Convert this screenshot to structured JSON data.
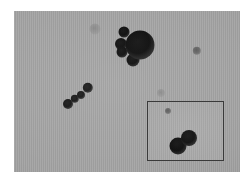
{
  "figure": {
    "kind": "microscopy-image",
    "modality": "grayscale transmission micrograph of spherical particles",
    "alt_text": "Grayscale micrograph showing dark spherical particles on a light gray background, with a boxed magnified inset of a two-particle dimer at bottom right",
    "canvas": {
      "width": 251,
      "height": 185,
      "background_color": "#ffffff"
    },
    "field": {
      "x": 14,
      "y": 11,
      "width": 226,
      "height": 161,
      "background_color": "#a3a3a3"
    },
    "colors": {
      "page_background": "#ffffff",
      "field_background": "#a3a3a3",
      "inset_background": "#a8a8a8",
      "inset_border": "#3a3a3a",
      "particle_dark": "#0d0d0d",
      "particle_mid": "#1d1d1d",
      "particle_faint": "#6a6a6a"
    },
    "main_particles": [
      {
        "id": "large-blob",
        "cx": 126,
        "cy": 34,
        "r": 14.5,
        "tone": "strong"
      },
      {
        "id": "satellite-top",
        "cx": 110,
        "cy": 21,
        "r": 5.5,
        "tone": "strong"
      },
      {
        "id": "satellite-left-up",
        "cx": 107,
        "cy": 33,
        "r": 6.0,
        "tone": "strong"
      },
      {
        "id": "satellite-left-lo",
        "cx": 108,
        "cy": 41,
        "r": 5.5,
        "tone": "strong"
      },
      {
        "id": "satellite-bottom",
        "cx": 119,
        "cy": 49,
        "r": 6.5,
        "tone": "strong"
      },
      {
        "id": "chain-1",
        "cx": 54,
        "cy": 93,
        "r": 5.0,
        "tone": "mid"
      },
      {
        "id": "chain-2",
        "cx": 61,
        "cy": 88,
        "r": 4.2,
        "tone": "mid"
      },
      {
        "id": "chain-3",
        "cx": 67,
        "cy": 84,
        "r": 4.0,
        "tone": "mid"
      },
      {
        "id": "chain-4",
        "cx": 74,
        "cy": 77,
        "r": 5.2,
        "tone": "mid"
      },
      {
        "id": "isolated-right",
        "cx": 183,
        "cy": 40,
        "r": 4.2,
        "tone": "faint"
      },
      {
        "id": "smudge-top-center",
        "cx": 81,
        "cy": 18,
        "r": 5.5,
        "tone": "ghost"
      },
      {
        "id": "smudge-mid-field",
        "cx": 147,
        "cy": 82,
        "r": 4.0,
        "tone": "ghost"
      }
    ],
    "inset": {
      "label": "magnified-inset",
      "x": 147,
      "y": 101,
      "width": 77,
      "height": 60,
      "border_width_px": 1,
      "particles": [
        {
          "id": "dimer-lower-left",
          "cx": 30,
          "cy": 44,
          "r": 8.5,
          "tone": "strong"
        },
        {
          "id": "dimer-upper-right",
          "cx": 41,
          "cy": 36,
          "r": 8.0,
          "tone": "strong"
        },
        {
          "id": "inset-speck",
          "cx": 20,
          "cy": 9,
          "r": 3.0,
          "tone": "faint"
        }
      ]
    }
  }
}
